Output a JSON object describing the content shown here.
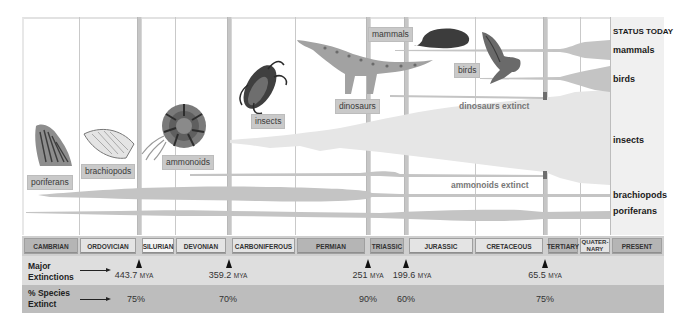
{
  "status_today": {
    "title": "STATUS TODAY",
    "groups": [
      {
        "label": "mammals",
        "y": 46
      },
      {
        "label": "birds",
        "y": 75
      },
      {
        "label": "insects",
        "y": 135
      },
      {
        "label": "brachiopods",
        "y": 191
      },
      {
        "label": "poriferans",
        "y": 207
      }
    ]
  },
  "organism_tags": {
    "poriferans": "poriferans",
    "brachiopods": "brachiopods",
    "ammonoids": "ammonoids",
    "insects": "insects",
    "dinosaurs": "dinosaurs",
    "mammals": "mammals",
    "birds": "birds"
  },
  "annotations": {
    "dinosaurs_extinct": "dinosaurs extinct",
    "ammonoids_extinct": "ammonoids extinct"
  },
  "periods": [
    {
      "name": "CAMBRIAN",
      "style": "dark"
    },
    {
      "name": "ORDOVICIAN",
      "style": "light"
    },
    {
      "name": "SILURIAN",
      "style": "white"
    },
    {
      "name": "DEVONIAN",
      "style": "light"
    },
    {
      "name": "CARBONIFEROUS",
      "style": "light"
    },
    {
      "name": "PERMIAN",
      "style": "dark"
    },
    {
      "name": "TRIASSIC",
      "style": "dark"
    },
    {
      "name": "JURASSIC",
      "style": "light"
    },
    {
      "name": "CRETACEOUS",
      "style": "light"
    },
    {
      "name": "TERTIARY",
      "style": "dark"
    },
    {
      "name": "QUATER-NARY",
      "style": "light"
    },
    {
      "name": "PRESENT",
      "style": "dark"
    }
  ],
  "rows": {
    "major_extinctions_label_1": "Major",
    "major_extinctions_label_2": "Extinctions",
    "species_extinct_label_1": "% Species",
    "species_extinct_label_2": "Extinct",
    "unit": "MYA"
  },
  "extinctions": [
    {
      "mya": "443.7",
      "percent": "75%"
    },
    {
      "mya": "359.2",
      "percent": "70%"
    },
    {
      "mya": "251",
      "percent": "90%"
    },
    {
      "mya": "199.6",
      "percent": "60%"
    },
    {
      "mya": "65.5",
      "percent": "75%"
    }
  ],
  "colors": {
    "band": "#c4c4c4",
    "band_light": "#e3e3e3",
    "extinct_marker": "#6e6e6e",
    "era_dark": "#b5b5b5",
    "era_light": "#e4e4e4"
  }
}
